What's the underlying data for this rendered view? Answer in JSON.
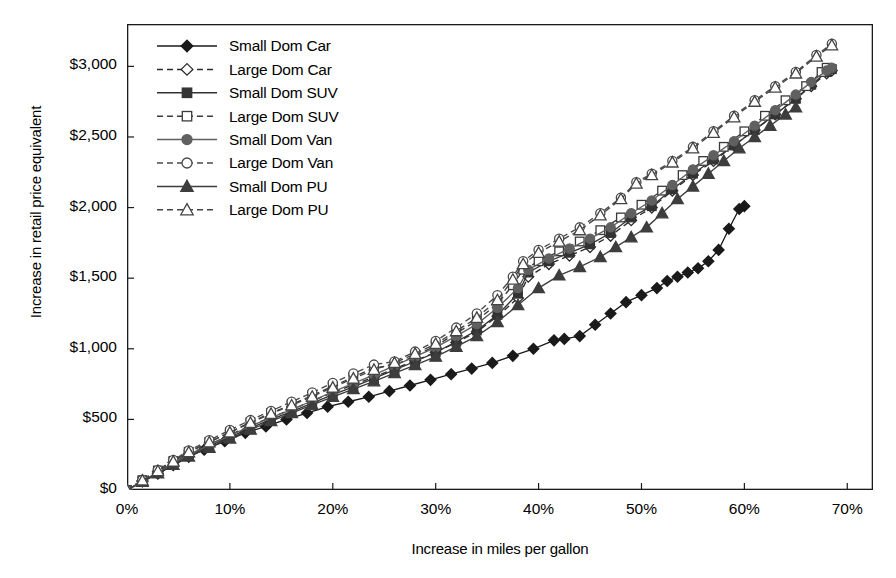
{
  "chart_data": {
    "type": "line",
    "title": "",
    "xlabel": "Increase in miles per gallon",
    "ylabel": "Increase in retail price equivalent",
    "xlim": [
      0,
      72.5
    ],
    "ylim": [
      0,
      3300
    ],
    "xticks": [
      "0%",
      "10%",
      "20%",
      "30%",
      "40%",
      "50%",
      "60%",
      "70%"
    ],
    "xtick_values": [
      0,
      10,
      20,
      30,
      40,
      50,
      60,
      70
    ],
    "yticks": [
      "$0",
      "$500",
      "$1,000",
      "$1,500",
      "$2,000",
      "$2,500",
      "$3,000"
    ],
    "ytick_values": [
      0,
      500,
      1000,
      1500,
      2000,
      2500,
      3000
    ],
    "grid": false,
    "legend_position": "top-left",
    "series": [
      {
        "name": "Small Dom Car",
        "marker": "filled-diamond",
        "line": "solid",
        "color": "#1a1a1a",
        "points": [
          [
            0,
            0
          ],
          [
            1.5,
            60
          ],
          [
            3,
            115
          ],
          [
            4.5,
            175
          ],
          [
            6,
            235
          ],
          [
            7.5,
            285
          ],
          [
            9.5,
            345
          ],
          [
            11.5,
            405
          ],
          [
            13.5,
            450
          ],
          [
            15.5,
            500
          ],
          [
            17.5,
            545
          ],
          [
            19.5,
            590
          ],
          [
            21.5,
            625
          ],
          [
            23.5,
            660
          ],
          [
            25.5,
            700
          ],
          [
            27.5,
            740
          ],
          [
            29.5,
            780
          ],
          [
            31.5,
            820
          ],
          [
            33.5,
            860
          ],
          [
            35.5,
            900
          ],
          [
            37.5,
            950
          ],
          [
            39.5,
            1000
          ],
          [
            41.5,
            1060
          ],
          [
            42.5,
            1070
          ],
          [
            44,
            1090
          ],
          [
            45.5,
            1170
          ],
          [
            47,
            1250
          ],
          [
            48.5,
            1330
          ],
          [
            50,
            1380
          ],
          [
            51.5,
            1430
          ],
          [
            52.5,
            1480
          ],
          [
            53.5,
            1510
          ],
          [
            54.5,
            1540
          ],
          [
            55.5,
            1570
          ],
          [
            56.5,
            1620
          ],
          [
            57.5,
            1700
          ],
          [
            58.5,
            1850
          ],
          [
            59.5,
            1990
          ],
          [
            60,
            2010
          ]
        ]
      },
      {
        "name": "Large Dom Car",
        "marker": "open-diamond",
        "line": "dashed",
        "color": "#2b2b2b",
        "points": [
          [
            0,
            0
          ],
          [
            1.5,
            65
          ],
          [
            3,
            130
          ],
          [
            4.5,
            195
          ],
          [
            6,
            255
          ],
          [
            8,
            320
          ],
          [
            10,
            390
          ],
          [
            12,
            455
          ],
          [
            14,
            515
          ],
          [
            16,
            570
          ],
          [
            18,
            630
          ],
          [
            20,
            690
          ],
          [
            22,
            745
          ],
          [
            24,
            800
          ],
          [
            26,
            860
          ],
          [
            28,
            915
          ],
          [
            30,
            975
          ],
          [
            32,
            1045
          ],
          [
            34,
            1120
          ],
          [
            36,
            1230
          ],
          [
            38,
            1360
          ],
          [
            39,
            1510
          ],
          [
            41,
            1600
          ],
          [
            43,
            1660
          ],
          [
            45,
            1720
          ],
          [
            47,
            1800
          ],
          [
            49,
            1910
          ],
          [
            51,
            2000
          ],
          [
            53,
            2120
          ],
          [
            55,
            2230
          ],
          [
            57,
            2330
          ],
          [
            59,
            2440
          ],
          [
            61,
            2550
          ],
          [
            63,
            2660
          ],
          [
            65,
            2770
          ],
          [
            66.5,
            2860
          ],
          [
            68,
            2950
          ],
          [
            68.5,
            2970
          ]
        ]
      },
      {
        "name": "Small Dom SUV",
        "marker": "filled-square",
        "line": "solid",
        "color": "#333333",
        "points": [
          [
            0,
            0
          ],
          [
            1.5,
            62
          ],
          [
            3,
            122
          ],
          [
            4.5,
            185
          ],
          [
            6,
            245
          ],
          [
            8,
            310
          ],
          [
            10,
            375
          ],
          [
            12,
            440
          ],
          [
            14,
            500
          ],
          [
            16,
            555
          ],
          [
            18,
            615
          ],
          [
            20,
            675
          ],
          [
            22,
            730
          ],
          [
            24,
            790
          ],
          [
            26,
            850
          ],
          [
            28,
            910
          ],
          [
            30,
            975
          ],
          [
            32,
            1050
          ],
          [
            34,
            1130
          ],
          [
            36,
            1240
          ],
          [
            38,
            1390
          ],
          [
            39,
            1540
          ],
          [
            41,
            1620
          ],
          [
            43,
            1680
          ],
          [
            45,
            1740
          ],
          [
            47,
            1820
          ],
          [
            49,
            1930
          ],
          [
            51,
            2010
          ],
          [
            53,
            2130
          ],
          [
            55,
            2240
          ],
          [
            57,
            2340
          ],
          [
            59,
            2440
          ],
          [
            61,
            2550
          ],
          [
            63,
            2660
          ],
          [
            65,
            2770
          ],
          [
            66.5,
            2870
          ],
          [
            68,
            2960
          ],
          [
            68.5,
            2980
          ]
        ]
      },
      {
        "name": "Large Dom SUV",
        "marker": "open-square",
        "line": "dashed",
        "color": "#3a3a3a",
        "points": [
          [
            0,
            0
          ],
          [
            1.5,
            70
          ],
          [
            3,
            138
          ],
          [
            4.5,
            205
          ],
          [
            6,
            270
          ],
          [
            8,
            340
          ],
          [
            10,
            410
          ],
          [
            12,
            480
          ],
          [
            14,
            545
          ],
          [
            16,
            605
          ],
          [
            18,
            670
          ],
          [
            20,
            735
          ],
          [
            22,
            800
          ],
          [
            24,
            865
          ],
          [
            26,
            885
          ],
          [
            28,
            950
          ],
          [
            30,
            1020
          ],
          [
            32,
            1110
          ],
          [
            34,
            1200
          ],
          [
            36,
            1320
          ],
          [
            37.5,
            1450
          ],
          [
            38.5,
            1560
          ],
          [
            40,
            1620
          ],
          [
            42,
            1690
          ],
          [
            44,
            1760
          ],
          [
            46,
            1840
          ],
          [
            48,
            1930
          ],
          [
            50,
            2020
          ],
          [
            52,
            2120
          ],
          [
            54,
            2230
          ],
          [
            56,
            2330
          ],
          [
            58,
            2430
          ],
          [
            60,
            2540
          ],
          [
            62,
            2650
          ],
          [
            64,
            2760
          ],
          [
            66,
            2860
          ],
          [
            67.5,
            2960
          ],
          [
            68,
            2990
          ]
        ]
      },
      {
        "name": "Small Dom Van",
        "marker": "filled-circle",
        "line": "solid",
        "color": "#606060",
        "points": [
          [
            0,
            0
          ],
          [
            1.5,
            64
          ],
          [
            3,
            126
          ],
          [
            4.5,
            190
          ],
          [
            6,
            250
          ],
          [
            8,
            318
          ],
          [
            10,
            385
          ],
          [
            12,
            452
          ],
          [
            14,
            512
          ],
          [
            16,
            570
          ],
          [
            18,
            632
          ],
          [
            20,
            695
          ],
          [
            22,
            755
          ],
          [
            24,
            815
          ],
          [
            26,
            880
          ],
          [
            28,
            945
          ],
          [
            30,
            1010
          ],
          [
            32,
            1090
          ],
          [
            34,
            1175
          ],
          [
            36,
            1290
          ],
          [
            38,
            1430
          ],
          [
            39,
            1560
          ],
          [
            41,
            1640
          ],
          [
            43,
            1710
          ],
          [
            45,
            1780
          ],
          [
            47,
            1860
          ],
          [
            49,
            1960
          ],
          [
            51,
            2050
          ],
          [
            53,
            2160
          ],
          [
            55,
            2270
          ],
          [
            57,
            2370
          ],
          [
            59,
            2470
          ],
          [
            61,
            2580
          ],
          [
            63,
            2690
          ],
          [
            65,
            2800
          ],
          [
            66.5,
            2890
          ],
          [
            68,
            2970
          ],
          [
            68.5,
            2990
          ]
        ]
      },
      {
        "name": "Large Dom Van",
        "marker": "open-circle",
        "line": "dashed",
        "color": "#4a4a4a",
        "points": [
          [
            0,
            0
          ],
          [
            1.5,
            72
          ],
          [
            3,
            142
          ],
          [
            4.5,
            212
          ],
          [
            6,
            280
          ],
          [
            8,
            352
          ],
          [
            10,
            425
          ],
          [
            12,
            495
          ],
          [
            14,
            560
          ],
          [
            16,
            625
          ],
          [
            18,
            690
          ],
          [
            20,
            758
          ],
          [
            22,
            825
          ],
          [
            24,
            888
          ],
          [
            26,
            910
          ],
          [
            28,
            980
          ],
          [
            30,
            1055
          ],
          [
            32,
            1150
          ],
          [
            34,
            1250
          ],
          [
            36,
            1380
          ],
          [
            37.5,
            1510
          ],
          [
            38.5,
            1620
          ],
          [
            40,
            1700
          ],
          [
            42,
            1780
          ],
          [
            44,
            1860
          ],
          [
            46,
            1960
          ],
          [
            48,
            2070
          ],
          [
            49.5,
            2180
          ],
          [
            51,
            2240
          ],
          [
            53,
            2330
          ],
          [
            55,
            2430
          ],
          [
            57,
            2540
          ],
          [
            59,
            2650
          ],
          [
            61,
            2760
          ],
          [
            63,
            2860
          ],
          [
            65,
            2960
          ],
          [
            67,
            3080
          ],
          [
            68.5,
            3160
          ]
        ]
      },
      {
        "name": "Small Dom PU",
        "marker": "filled-triangle",
        "line": "solid",
        "color": "#3d3d3d",
        "points": [
          [
            0,
            0
          ],
          [
            1.5,
            58
          ],
          [
            3,
            118
          ],
          [
            4.5,
            178
          ],
          [
            6,
            238
          ],
          [
            8,
            300
          ],
          [
            10,
            365
          ],
          [
            12,
            428
          ],
          [
            14,
            488
          ],
          [
            16,
            545
          ],
          [
            18,
            602
          ],
          [
            20,
            660
          ],
          [
            22,
            715
          ],
          [
            24,
            770
          ],
          [
            26,
            828
          ],
          [
            28,
            885
          ],
          [
            30,
            945
          ],
          [
            32,
            1015
          ],
          [
            34,
            1090
          ],
          [
            36,
            1190
          ],
          [
            38,
            1310
          ],
          [
            40,
            1430
          ],
          [
            42,
            1520
          ],
          [
            44,
            1580
          ],
          [
            46,
            1650
          ],
          [
            47.5,
            1720
          ],
          [
            49,
            1790
          ],
          [
            50.5,
            1860
          ],
          [
            52,
            1960
          ],
          [
            53.5,
            2060
          ],
          [
            55,
            2150
          ],
          [
            56.5,
            2240
          ],
          [
            58,
            2330
          ],
          [
            59.5,
            2420
          ],
          [
            61,
            2500
          ],
          [
            62.5,
            2580
          ],
          [
            64,
            2660
          ],
          [
            65,
            2710
          ]
        ]
      },
      {
        "name": "Large Dom PU",
        "marker": "open-triangle",
        "line": "dashed",
        "color": "#444444",
        "points": [
          [
            0,
            0
          ],
          [
            1.5,
            68
          ],
          [
            3,
            135
          ],
          [
            4.5,
            202
          ],
          [
            6,
            268
          ],
          [
            8,
            338
          ],
          [
            10,
            408
          ],
          [
            12,
            476
          ],
          [
            14,
            540
          ],
          [
            16,
            600
          ],
          [
            18,
            662
          ],
          [
            20,
            726
          ],
          [
            22,
            790
          ],
          [
            24,
            852
          ],
          [
            26,
            900
          ],
          [
            28,
            965
          ],
          [
            30,
            1035
          ],
          [
            32,
            1125
          ],
          [
            34,
            1220
          ],
          [
            36,
            1345
          ],
          [
            37.5,
            1490
          ],
          [
            38.5,
            1600
          ],
          [
            40,
            1680
          ],
          [
            42,
            1760
          ],
          [
            44,
            1840
          ],
          [
            46,
            1945
          ],
          [
            48,
            2060
          ],
          [
            49.5,
            2170
          ],
          [
            51,
            2230
          ],
          [
            53,
            2320
          ],
          [
            55,
            2420
          ],
          [
            57,
            2530
          ],
          [
            59,
            2640
          ],
          [
            61,
            2750
          ],
          [
            63,
            2850
          ],
          [
            65,
            2950
          ],
          [
            67,
            3070
          ],
          [
            68.5,
            3150
          ]
        ]
      }
    ],
    "legend_entries": [
      "Small Dom Car",
      "Large Dom Car",
      "Small Dom SUV",
      "Large Dom SUV",
      "Small Dom Van",
      "Large Dom Van",
      "Small Dom PU",
      "Large Dom PU"
    ]
  }
}
